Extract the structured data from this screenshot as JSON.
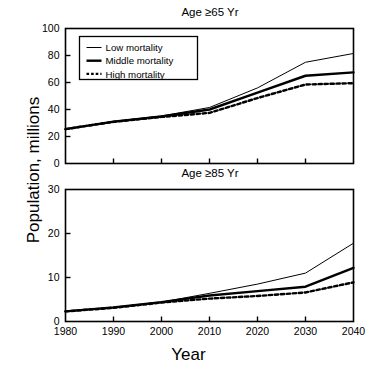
{
  "axis": {
    "ylabel": "Population, millions",
    "xlabel": "Year"
  },
  "legend": {
    "items": [
      {
        "label": "Low mortality",
        "style": "thin-solid"
      },
      {
        "label": "Middle mortality",
        "style": "thick-solid"
      },
      {
        "label": "High mortality",
        "style": "dotted"
      }
    ]
  },
  "chart_data": [
    {
      "type": "line",
      "title": "Age ≥65 Yr",
      "xlabel": "Year",
      "ylabel": "Population, millions",
      "xlim": [
        1980,
        2040
      ],
      "ylim": [
        0,
        100
      ],
      "xticks": [
        1980,
        1990,
        2000,
        2010,
        2020,
        2030,
        2040
      ],
      "yticks": [
        0,
        20,
        40,
        60,
        80,
        100
      ],
      "xticklabels": [
        "1980",
        "1990",
        "2000",
        "2010",
        "2020",
        "2030",
        "2040"
      ],
      "yticklabels": [
        "0",
        "20",
        "40",
        "60",
        "80",
        "100"
      ],
      "grid": false,
      "legend_position": "upper left",
      "x": [
        1980,
        1990,
        2000,
        2010,
        2020,
        2030,
        2040
      ],
      "series": [
        {
          "name": "Low mortality",
          "values": [
            25.5,
            31.2,
            35.2,
            41.5,
            56.0,
            75.0,
            81.5
          ]
        },
        {
          "name": "Middle mortality",
          "values": [
            25.5,
            31.0,
            34.8,
            40.0,
            52.5,
            65.0,
            67.5
          ]
        },
        {
          "name": "High mortality",
          "values": [
            25.5,
            30.8,
            34.5,
            37.5,
            48.5,
            58.5,
            59.5
          ]
        }
      ]
    },
    {
      "type": "line",
      "title": "Age ≥85 Yr",
      "xlabel": "Year",
      "ylabel": "Population, millions",
      "xlim": [
        1980,
        2040
      ],
      "ylim": [
        0,
        30
      ],
      "xticks": [
        1980,
        1990,
        2000,
        2010,
        2020,
        2030,
        2040
      ],
      "yticks": [
        0,
        10,
        20,
        30
      ],
      "xticklabels": [
        "1980",
        "1990",
        "2000",
        "2010",
        "2020",
        "2030",
        "2040"
      ],
      "yticklabels": [
        "0",
        "10",
        "20",
        "30"
      ],
      "grid": false,
      "legend_position": "none",
      "x": [
        1980,
        1990,
        2000,
        2010,
        2020,
        2030,
        2040
      ],
      "series": [
        {
          "name": "Low mortality",
          "values": [
            2.3,
            3.2,
            4.4,
            6.4,
            8.5,
            11.0,
            17.8
          ]
        },
        {
          "name": "Middle mortality",
          "values": [
            2.3,
            3.2,
            4.4,
            5.9,
            6.9,
            7.9,
            12.2
          ]
        },
        {
          "name": "High mortality",
          "values": [
            2.3,
            3.1,
            4.3,
            5.2,
            5.8,
            6.6,
            8.9
          ]
        }
      ]
    }
  ]
}
